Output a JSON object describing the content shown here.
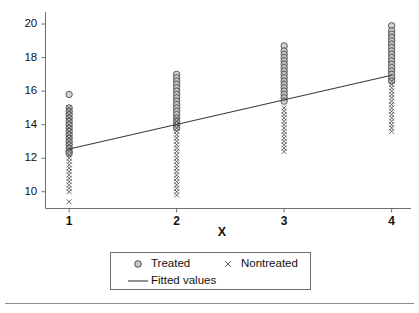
{
  "chart_data": {
    "type": "scatter",
    "title": "",
    "xlabel": "X",
    "ylabel": "",
    "xlim": [
      0.78,
      4.18
    ],
    "ylim": [
      9.0,
      20.6
    ],
    "grid": false,
    "legend_position": "below-axes",
    "xticks": [
      1,
      2,
      3,
      4
    ],
    "xticklabels": [
      "1",
      "2",
      "3",
      "4"
    ],
    "yticks": [
      10,
      12,
      14,
      16,
      18,
      20
    ],
    "yticklabels": [
      "10",
      "12",
      "14",
      "16",
      "18",
      "20"
    ],
    "series": [
      {
        "name": "Treated",
        "marker": "circle",
        "marker_color": "#9a9a9a",
        "marker_edge_color": "#4a4a4a",
        "points": [
          {
            "x": 1,
            "y": 15.8
          },
          {
            "x": 1,
            "y": 15.0
          },
          {
            "x": 1,
            "y": 14.8
          },
          {
            "x": 1,
            "y": 14.6
          },
          {
            "x": 1,
            "y": 14.4
          },
          {
            "x": 1,
            "y": 14.2
          },
          {
            "x": 1,
            "y": 14.0
          },
          {
            "x": 1,
            "y": 13.8
          },
          {
            "x": 1,
            "y": 13.6
          },
          {
            "x": 1,
            "y": 13.4
          },
          {
            "x": 1,
            "y": 13.2
          },
          {
            "x": 1,
            "y": 13.0
          },
          {
            "x": 1,
            "y": 12.8
          },
          {
            "x": 1,
            "y": 12.6
          },
          {
            "x": 1,
            "y": 12.4
          },
          {
            "x": 1,
            "y": 12.3
          },
          {
            "x": 2,
            "y": 17.0
          },
          {
            "x": 2,
            "y": 16.8
          },
          {
            "x": 2,
            "y": 16.6
          },
          {
            "x": 2,
            "y": 16.4
          },
          {
            "x": 2,
            "y": 16.2
          },
          {
            "x": 2,
            "y": 16.0
          },
          {
            "x": 2,
            "y": 15.8
          },
          {
            "x": 2,
            "y": 15.6
          },
          {
            "x": 2,
            "y": 15.4
          },
          {
            "x": 2,
            "y": 15.2
          },
          {
            "x": 2,
            "y": 15.0
          },
          {
            "x": 2,
            "y": 14.8
          },
          {
            "x": 2,
            "y": 14.6
          },
          {
            "x": 2,
            "y": 14.4
          },
          {
            "x": 2,
            "y": 14.2
          },
          {
            "x": 2,
            "y": 14.0
          },
          {
            "x": 2,
            "y": 13.8
          },
          {
            "x": 3,
            "y": 18.7
          },
          {
            "x": 3,
            "y": 18.4
          },
          {
            "x": 3,
            "y": 18.2
          },
          {
            "x": 3,
            "y": 18.0
          },
          {
            "x": 3,
            "y": 17.8
          },
          {
            "x": 3,
            "y": 17.6
          },
          {
            "x": 3,
            "y": 17.4
          },
          {
            "x": 3,
            "y": 17.2
          },
          {
            "x": 3,
            "y": 17.0
          },
          {
            "x": 3,
            "y": 16.8
          },
          {
            "x": 3,
            "y": 16.6
          },
          {
            "x": 3,
            "y": 16.4
          },
          {
            "x": 3,
            "y": 16.2
          },
          {
            "x": 3,
            "y": 16.0
          },
          {
            "x": 3,
            "y": 15.8
          },
          {
            "x": 3,
            "y": 15.6
          },
          {
            "x": 3,
            "y": 15.4
          },
          {
            "x": 4,
            "y": 19.9
          },
          {
            "x": 4,
            "y": 19.6
          },
          {
            "x": 4,
            "y": 19.4
          },
          {
            "x": 4,
            "y": 19.2
          },
          {
            "x": 4,
            "y": 19.0
          },
          {
            "x": 4,
            "y": 18.8
          },
          {
            "x": 4,
            "y": 18.6
          },
          {
            "x": 4,
            "y": 18.4
          },
          {
            "x": 4,
            "y": 18.2
          },
          {
            "x": 4,
            "y": 18.0
          },
          {
            "x": 4,
            "y": 17.8
          },
          {
            "x": 4,
            "y": 17.6
          },
          {
            "x": 4,
            "y": 17.4
          },
          {
            "x": 4,
            "y": 17.2
          },
          {
            "x": 4,
            "y": 17.0
          },
          {
            "x": 4,
            "y": 16.8
          },
          {
            "x": 4,
            "y": 16.6
          }
        ]
      },
      {
        "name": "Nontreated",
        "marker": "x",
        "marker_color": "#575757",
        "points": [
          {
            "x": 1,
            "y": 15.0
          },
          {
            "x": 1,
            "y": 14.8
          },
          {
            "x": 1,
            "y": 14.6
          },
          {
            "x": 1,
            "y": 14.4
          },
          {
            "x": 1,
            "y": 14.2
          },
          {
            "x": 1,
            "y": 14.0
          },
          {
            "x": 1,
            "y": 13.8
          },
          {
            "x": 1,
            "y": 13.6
          },
          {
            "x": 1,
            "y": 13.4
          },
          {
            "x": 1,
            "y": 13.2
          },
          {
            "x": 1,
            "y": 13.0
          },
          {
            "x": 1,
            "y": 12.8
          },
          {
            "x": 1,
            "y": 12.6
          },
          {
            "x": 1,
            "y": 12.4
          },
          {
            "x": 1,
            "y": 12.2
          },
          {
            "x": 1,
            "y": 12.0
          },
          {
            "x": 1,
            "y": 11.8
          },
          {
            "x": 1,
            "y": 11.6
          },
          {
            "x": 1,
            "y": 11.4
          },
          {
            "x": 1,
            "y": 11.2
          },
          {
            "x": 1,
            "y": 11.0
          },
          {
            "x": 1,
            "y": 10.8
          },
          {
            "x": 1,
            "y": 10.6
          },
          {
            "x": 1,
            "y": 10.4
          },
          {
            "x": 1,
            "y": 10.2
          },
          {
            "x": 1,
            "y": 10.0
          },
          {
            "x": 1,
            "y": 9.4
          },
          {
            "x": 2,
            "y": 14.4
          },
          {
            "x": 2,
            "y": 14.2
          },
          {
            "x": 2,
            "y": 14.0
          },
          {
            "x": 2,
            "y": 13.8
          },
          {
            "x": 2,
            "y": 13.6
          },
          {
            "x": 2,
            "y": 13.4
          },
          {
            "x": 2,
            "y": 13.2
          },
          {
            "x": 2,
            "y": 13.0
          },
          {
            "x": 2,
            "y": 12.8
          },
          {
            "x": 2,
            "y": 12.6
          },
          {
            "x": 2,
            "y": 12.4
          },
          {
            "x": 2,
            "y": 12.2
          },
          {
            "x": 2,
            "y": 12.0
          },
          {
            "x": 2,
            "y": 11.8
          },
          {
            "x": 2,
            "y": 11.6
          },
          {
            "x": 2,
            "y": 11.4
          },
          {
            "x": 2,
            "y": 11.2
          },
          {
            "x": 2,
            "y": 11.0
          },
          {
            "x": 2,
            "y": 10.8
          },
          {
            "x": 2,
            "y": 10.6
          },
          {
            "x": 2,
            "y": 10.4
          },
          {
            "x": 2,
            "y": 10.2
          },
          {
            "x": 2,
            "y": 10.0
          },
          {
            "x": 2,
            "y": 9.8
          },
          {
            "x": 3,
            "y": 15.0
          },
          {
            "x": 3,
            "y": 14.8
          },
          {
            "x": 3,
            "y": 14.6
          },
          {
            "x": 3,
            "y": 14.4
          },
          {
            "x": 3,
            "y": 14.2
          },
          {
            "x": 3,
            "y": 14.0
          },
          {
            "x": 3,
            "y": 13.8
          },
          {
            "x": 3,
            "y": 13.6
          },
          {
            "x": 3,
            "y": 13.4
          },
          {
            "x": 3,
            "y": 13.2
          },
          {
            "x": 3,
            "y": 13.0
          },
          {
            "x": 3,
            "y": 12.8
          },
          {
            "x": 3,
            "y": 12.6
          },
          {
            "x": 3,
            "y": 12.4
          },
          {
            "x": 4,
            "y": 16.6
          },
          {
            "x": 4,
            "y": 16.4
          },
          {
            "x": 4,
            "y": 16.2
          },
          {
            "x": 4,
            "y": 16.0
          },
          {
            "x": 4,
            "y": 15.8
          },
          {
            "x": 4,
            "y": 15.6
          },
          {
            "x": 4,
            "y": 15.4
          },
          {
            "x": 4,
            "y": 15.2
          },
          {
            "x": 4,
            "y": 15.0
          },
          {
            "x": 4,
            "y": 14.8
          },
          {
            "x": 4,
            "y": 14.6
          },
          {
            "x": 4,
            "y": 14.4
          },
          {
            "x": 4,
            "y": 14.2
          },
          {
            "x": 4,
            "y": 14.0
          },
          {
            "x": 4,
            "y": 13.8
          },
          {
            "x": 4,
            "y": 13.6
          }
        ]
      },
      {
        "name": "Fitted values",
        "marker": "line",
        "line_color": "#3a3a3a",
        "points": [
          {
            "x": 1,
            "y": 12.55
          },
          {
            "x": 4,
            "y": 16.95
          }
        ]
      }
    ]
  },
  "axis": {
    "x_title": "X",
    "x_tick_labels": [
      "1",
      "2",
      "3",
      "4"
    ],
    "y_tick_labels": [
      "20",
      "18",
      "16",
      "14",
      "12",
      "10"
    ]
  },
  "legend": {
    "entries": [
      {
        "label": "Treated",
        "key": "circle-marker-icon"
      },
      {
        "label": "Nontreated",
        "key": "x-marker-icon"
      },
      {
        "label": "Fitted values",
        "key": "line-key-icon"
      }
    ]
  },
  "colors": {
    "axis": "#6e6e6e",
    "text": "#111111",
    "marker_circle_fill": "#9a9a9a",
    "marker_circle_edge": "#4a4a4a",
    "marker_x": "#575757",
    "fit_line": "#3a3a3a",
    "rule": "#8c8c8c"
  }
}
